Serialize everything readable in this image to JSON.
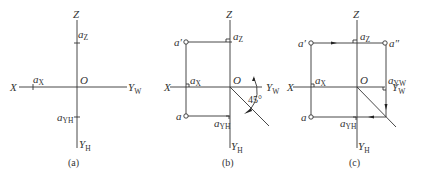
{
  "panels": [
    {
      "id": "a",
      "caption": "(a)",
      "labels": {
        "Z": "Z",
        "X": "X",
        "O": "O",
        "YW": "Y",
        "YW_sub": "W",
        "YH": "Y",
        "YH_sub": "H",
        "aX": "a",
        "aX_sub": "X",
        "aZ": "a",
        "aZ_sub": "Z",
        "aYH": "a",
        "aYH_sub": "YH"
      }
    },
    {
      "id": "b",
      "caption": "(b)",
      "labels": {
        "Z": "Z",
        "X": "X",
        "O": "O",
        "YW": "Y",
        "YW_sub": "W",
        "YH": "Y",
        "YH_sub": "H",
        "aX": "a",
        "aX_sub": "X",
        "aZ": "a",
        "aZ_sub": "Z",
        "aYH": "a",
        "aYH_sub": "YH",
        "a_prime": "a′",
        "a": "a",
        "angle": "45°"
      }
    },
    {
      "id": "c",
      "caption": "(c)",
      "labels": {
        "Z": "Z",
        "X": "X",
        "O": "O",
        "YW": "Y",
        "YW_sub": "W",
        "YH": "Y",
        "YH_sub": "H",
        "aX": "a",
        "aX_sub": "X",
        "aZ": "a",
        "aZ_sub": "Z",
        "aYH": "a",
        "aYH_sub": "YH",
        "aYW": "a",
        "aYW_sub": "YW",
        "a_prime": "a′",
        "a_double_prime": "a″",
        "a": "a"
      }
    }
  ]
}
